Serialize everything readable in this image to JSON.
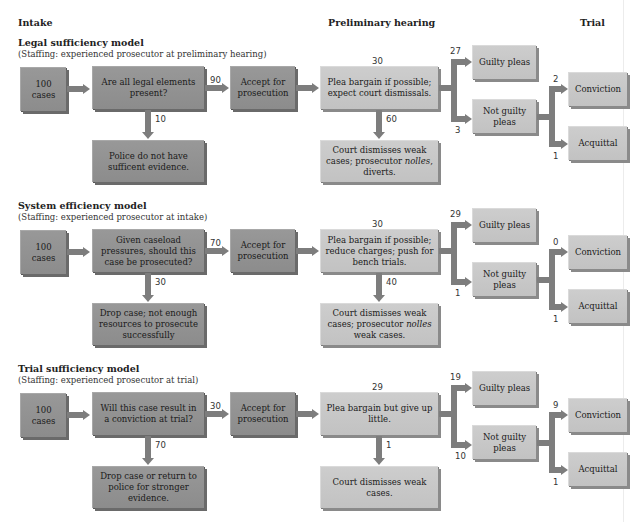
{
  "columns": {
    "intake": "Intake",
    "preliminary": "Preliminary hearing",
    "trial": "Trial"
  },
  "models": [
    {
      "title": "Legal sufficiency model",
      "staffing": "(Staffing: experienced prosecutor at preliminary hearing)",
      "start": "100 cases",
      "question": "Are all legal elements present?",
      "accepted_count": "90",
      "rejected_count": "10",
      "accept": "Accept for prosecution",
      "rejected": "Police do not have sufficent evidence.",
      "prelim_count": "30",
      "prelim": "Plea bargain if possible; expect court dismissals.",
      "dismiss_count": "60",
      "dismiss_pre": "Court dismisses weak cases; prosecutor ",
      "dismiss_em": "nolles",
      "dismiss_post": ", diverts.",
      "guilty_count": "27",
      "guilty": "Guilty pleas",
      "notguilty_count": "3",
      "notguilty": "Not guilty pleas",
      "conviction_count": "2",
      "conviction": "Conviction",
      "acquittal_count": "1",
      "acquittal": "Acquittal"
    },
    {
      "title": "System efficiency model",
      "staffing": "(Staffing: experienced prosecutor at intake)",
      "start": "100 cases",
      "question": "Given caseload pressures, should this case be prosecuted?",
      "accepted_count": "70",
      "rejected_count": "30",
      "accept": "Accept for prosecution",
      "rejected": "Drop case; not enough resources to prosecute successfully",
      "prelim_count": "30",
      "prelim": "Plea bargain if possible; reduce charges; push for bench trials.",
      "dismiss_count": "40",
      "dismiss_pre": "Court dismisses weak cases; prosecutor ",
      "dismiss_em": "nolles",
      "dismiss_post": " weak cases.",
      "guilty_count": "29",
      "guilty": "Guilty pleas",
      "notguilty_count": "1",
      "notguilty": "Not guilty pleas",
      "conviction_count": "0",
      "conviction": "Conviction",
      "acquittal_count": "1",
      "acquittal": "Acquittal"
    },
    {
      "title": "Trial sufficiency model",
      "staffing": "(Staffing: experienced prosecutor at trial)",
      "start": "100 cases",
      "question": "Will this case result in a conviction at trial?",
      "accepted_count": "30",
      "rejected_count": "70",
      "accept": "Accept for prosecution",
      "rejected": "Drop case or return to police for stronger evidence.",
      "prelim_count": "29",
      "prelim": "Plea bargain but give up little.",
      "dismiss_count": "1",
      "dismiss_pre": "Court dismisses weak cases.",
      "dismiss_em": "",
      "dismiss_post": "",
      "guilty_count": "19",
      "guilty": "Guilty pleas",
      "notguilty_count": "10",
      "notguilty": "Not guilty pleas",
      "conviction_count": "9",
      "conviction": "Conviction",
      "acquittal_count": "1",
      "acquittal": "Acquittal"
    }
  ],
  "colors": {
    "dark_box": "#8f8f8f",
    "light_box": "#c6c6c6",
    "arrow": "#7d7d7d"
  }
}
